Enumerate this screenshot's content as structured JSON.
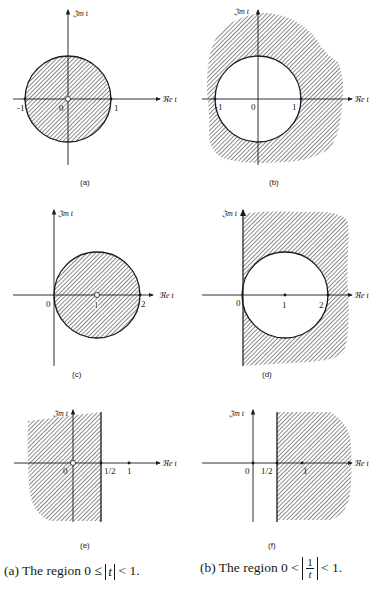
{
  "figure": {
    "axis_labels": {
      "imaginary": "𝔍m t",
      "real": "ℜe t"
    },
    "panels": [
      {
        "id": "a",
        "caption": "(a)",
        "description": "Hatched unit disk |t| < 1",
        "tick_labels": [
          "-1",
          "0",
          "1"
        ]
      },
      {
        "id": "b",
        "caption": "(b)",
        "description": "Hatched exterior of unit circle",
        "tick_labels": [
          "-1",
          "0",
          "1"
        ]
      },
      {
        "id": "c",
        "caption": "(c)",
        "description": "Hatched disk centered at 1 with radius 1",
        "tick_labels": [
          "0",
          "1",
          "2"
        ]
      },
      {
        "id": "d",
        "caption": "(d)",
        "description": "Hatched exterior of disk centered at 1, right half-plane",
        "tick_labels": [
          "0",
          "1",
          "2"
        ]
      },
      {
        "id": "e",
        "caption": "(e)",
        "description": "Hatched half-plane Re t < 1/2",
        "tick_labels": [
          "0",
          "1/2",
          "1"
        ]
      },
      {
        "id": "f",
        "caption": "(f)",
        "description": "Hatched half-plane Re t > 1/2",
        "tick_labels": [
          "0",
          "1/2",
          "1"
        ]
      }
    ]
  },
  "captions": {
    "left": {
      "prefix": "(a) The region 0 ≤ ",
      "abs": "t",
      "suffix": " < 1."
    },
    "right": {
      "prefix": "(b) The region 0 < ",
      "num": "1",
      "den": "t",
      "suffix": " < 1."
    }
  }
}
